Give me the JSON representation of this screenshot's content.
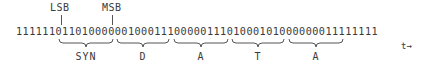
{
  "markers": {
    "lsb": "LSB",
    "msb": "MSB"
  },
  "bitstream": "1111110110100000010001110000011101000101000000011111111",
  "groups": [
    {
      "label": "SYN",
      "x1": 59,
      "x2": 113
    },
    {
      "label": "D",
      "x1": 117,
      "x2": 170
    },
    {
      "label": "A",
      "x1": 174,
      "x2": 228
    },
    {
      "label": "T",
      "x1": 232,
      "x2": 285
    },
    {
      "label": "A",
      "x1": 289,
      "x2": 343
    }
  ],
  "time_axis": "t→"
}
